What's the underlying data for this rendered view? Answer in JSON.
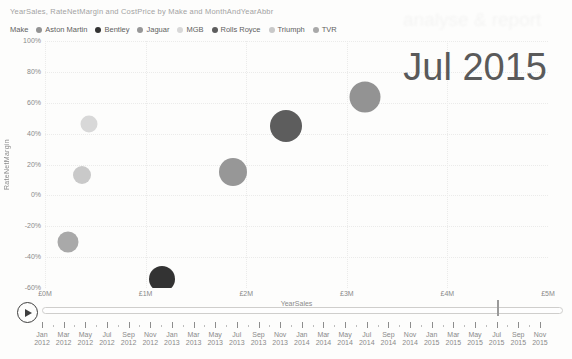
{
  "title": "YearSales, RateNetMargin and CostPrice by Make and MonthAndYearAbbr",
  "watermark_text": "analyse & report",
  "frame_label": "Jul 2015",
  "legend": {
    "label": "Make",
    "items": [
      {
        "name": "Aston Martin",
        "color": "#939393"
      },
      {
        "name": "Bentley",
        "color": "#333333"
      },
      {
        "name": "Jaguar",
        "color": "#979797"
      },
      {
        "name": "MGB",
        "color": "#d8d8d8"
      },
      {
        "name": "Rolls Royce",
        "color": "#5d5d5d"
      },
      {
        "name": "Triumph",
        "color": "#c9c9c9"
      },
      {
        "name": "TVR",
        "color": "#a9a9a9"
      }
    ]
  },
  "chart_data": {
    "type": "scatter",
    "title": "YearSales, RateNetMargin and CostPrice by Make and MonthAndYearAbbr",
    "xlabel": "YearSales",
    "ylabel": "RateNetMargin",
    "grid": true,
    "legend_position": "top",
    "x_axis": {
      "range": [
        0,
        5
      ],
      "ticks": [
        {
          "value": 0,
          "label": "£0M"
        },
        {
          "value": 1,
          "label": "£1M"
        },
        {
          "value": 2,
          "label": "£2M"
        },
        {
          "value": 3,
          "label": "£3M"
        },
        {
          "value": 4,
          "label": "£4M"
        },
        {
          "value": 5,
          "label": "£5M"
        }
      ]
    },
    "y_axis": {
      "range": [
        -60,
        100
      ],
      "ticks": [
        {
          "value": 100,
          "label": "100%"
        },
        {
          "value": 80,
          "label": "80%"
        },
        {
          "value": 60,
          "label": "60%"
        },
        {
          "value": 40,
          "label": "40%"
        },
        {
          "value": 20,
          "label": "20%"
        },
        {
          "value": 0,
          "label": "0%"
        },
        {
          "value": -20,
          "label": "-20%"
        },
        {
          "value": -40,
          "label": "-40%"
        },
        {
          "value": -60,
          "label": "-60%"
        }
      ]
    },
    "points": [
      {
        "make": "Aston Martin",
        "x_sales_m": 3.18,
        "y_margin_pct": 64,
        "r_px": 15.5,
        "color": "#939393"
      },
      {
        "make": "Bentley",
        "x_sales_m": 1.16,
        "y_margin_pct": -54,
        "r_px": 13,
        "color": "#333333"
      },
      {
        "make": "Jaguar",
        "x_sales_m": 1.87,
        "y_margin_pct": 15,
        "r_px": 14,
        "color": "#979797"
      },
      {
        "make": "MGB",
        "x_sales_m": 0.44,
        "y_margin_pct": 46,
        "r_px": 8.5,
        "color": "#d8d8d8"
      },
      {
        "make": "Rolls Royce",
        "x_sales_m": 2.4,
        "y_margin_pct": 45,
        "r_px": 16,
        "color": "#5d5d5d"
      },
      {
        "make": "Triumph",
        "x_sales_m": 0.37,
        "y_margin_pct": 13,
        "r_px": 9,
        "color": "#c9c9c9"
      },
      {
        "make": "TVR",
        "x_sales_m": 0.23,
        "y_margin_pct": -30,
        "r_px": 10.5,
        "color": "#a9a9a9"
      }
    ]
  },
  "timeline": {
    "selected_label": "Jul 2015",
    "selected_index": 21,
    "labels": [
      {
        "month": "Jan",
        "year": "2012"
      },
      {
        "month": "Mar",
        "year": "2012"
      },
      {
        "month": "May",
        "year": "2012"
      },
      {
        "month": "Jul",
        "year": "2012"
      },
      {
        "month": "Sep",
        "year": "2012"
      },
      {
        "month": "Nov",
        "year": "2012"
      },
      {
        "month": "Jan",
        "year": "2013"
      },
      {
        "month": "Mar",
        "year": "2013"
      },
      {
        "month": "May",
        "year": "2013"
      },
      {
        "month": "Jul",
        "year": "2013"
      },
      {
        "month": "Sep",
        "year": "2013"
      },
      {
        "month": "Nov",
        "year": "2013"
      },
      {
        "month": "Jan",
        "year": "2014"
      },
      {
        "month": "Mar",
        "year": "2014"
      },
      {
        "month": "May",
        "year": "2014"
      },
      {
        "month": "Jul",
        "year": "2014"
      },
      {
        "month": "Sep",
        "year": "2014"
      },
      {
        "month": "Nov",
        "year": "2014"
      },
      {
        "month": "Jan",
        "year": "2015"
      },
      {
        "month": "Mar",
        "year": "2015"
      },
      {
        "month": "May",
        "year": "2015"
      },
      {
        "month": "Jul",
        "year": "2015"
      },
      {
        "month": "Sep",
        "year": "2015"
      },
      {
        "month": "Nov",
        "year": "2015"
      }
    ]
  }
}
